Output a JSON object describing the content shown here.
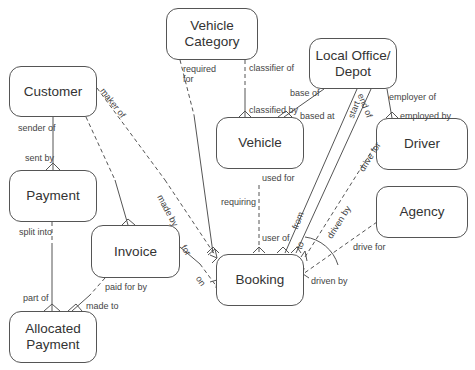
{
  "diagram": {
    "type": "entity-relationship",
    "entities": [
      {
        "id": "vehicle_category",
        "label": "Vehicle\nCategory"
      },
      {
        "id": "local_office",
        "label": "Local Office/\nDepot"
      },
      {
        "id": "customer",
        "label": "Customer"
      },
      {
        "id": "vehicle",
        "label": "Vehicle"
      },
      {
        "id": "driver",
        "label": "Driver"
      },
      {
        "id": "payment",
        "label": "Payment"
      },
      {
        "id": "agency",
        "label": "Agency"
      },
      {
        "id": "invoice",
        "label": "Invoice"
      },
      {
        "id": "booking",
        "label": "Booking"
      },
      {
        "id": "allocated_payment",
        "label": "Allocated\nPayment"
      }
    ],
    "labels": {
      "required_for": "required\nfor",
      "classifier_of": "classifier of",
      "classified_by": "classified by",
      "base_of": "base of",
      "based_at": "based at",
      "employer_of": "employer of",
      "employed_by": "employed by",
      "maker_of": "maker of",
      "made_by": "made by",
      "sender_of": "sender of",
      "sent_by": "sent by",
      "split_into": "split into",
      "part_of": "part of",
      "paid_for_by": "paid for by",
      "made_to": "made to",
      "for": "for",
      "on": "on",
      "requiring": "requiring",
      "used_for": "used for",
      "user_of": "user of",
      "start": "start",
      "end_of": "end of",
      "from": "from",
      "to": "to",
      "drive_for_driver": "drive for",
      "driven_by_driver": "driven by",
      "drive_for_agency": "drive for",
      "driven_by_agency": "driven by"
    },
    "relationships": [
      {
        "from": "Vehicle Category",
        "to": "Vehicle",
        "labels": [
          "classifier of",
          "classified by"
        ]
      },
      {
        "from": "Vehicle Category",
        "to": "Booking",
        "labels": [
          "required for",
          "requiring"
        ]
      },
      {
        "from": "Local Office/Depot",
        "to": "Vehicle",
        "labels": [
          "base of",
          "based at"
        ]
      },
      {
        "from": "Local Office/Depot",
        "to": "Driver",
        "labels": [
          "employer of",
          "employed by"
        ]
      },
      {
        "from": "Local Office/Depot",
        "to": "Booking",
        "labels": [
          "start",
          "from"
        ]
      },
      {
        "from": "Local Office/Depot",
        "to": "Booking",
        "labels": [
          "end of",
          "to"
        ]
      },
      {
        "from": "Customer",
        "to": "Payment",
        "labels": [
          "sender of",
          "sent by"
        ]
      },
      {
        "from": "Customer",
        "to": "Booking",
        "labels": [
          "maker of",
          "made by"
        ]
      },
      {
        "from": "Customer",
        "to": "Invoice",
        "labels": []
      },
      {
        "from": "Payment",
        "to": "Allocated Payment",
        "labels": [
          "split into",
          "part of"
        ]
      },
      {
        "from": "Invoice",
        "to": "Allocated Payment",
        "labels": [
          "paid for by",
          "made to"
        ]
      },
      {
        "from": "Invoice",
        "to": "Booking",
        "labels": [
          "for",
          "on"
        ]
      },
      {
        "from": "Vehicle",
        "to": "Booking",
        "labels": [
          "used for",
          "user of"
        ]
      },
      {
        "from": "Driver",
        "to": "Booking",
        "labels": [
          "drive for",
          "driven by"
        ]
      },
      {
        "from": "Agency",
        "to": "Booking",
        "labels": [
          "drive for",
          "driven by"
        ]
      }
    ]
  }
}
